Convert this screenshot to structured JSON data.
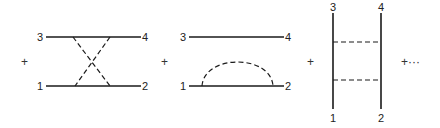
{
  "diagram": {
    "type": "feynman-diagram-series",
    "operators": [
      "+",
      "+",
      "+",
      "+···"
    ],
    "terms": [
      {
        "name": "crossed-exchange",
        "labels": {
          "top_left": "3",
          "top_right": "4",
          "bottom_left": "1",
          "bottom_right": "2"
        },
        "solid_lines": [
          "1-2 horizontal",
          "3-4 horizontal"
        ],
        "dashed_lines": [
          "crossed pair connecting top and bottom lines"
        ]
      },
      {
        "name": "self-energy-loop",
        "labels": {
          "top_left": "3",
          "top_right": "4",
          "bottom_left": "1",
          "bottom_right": "2"
        },
        "solid_lines": [
          "1-2 horizontal",
          "3-4 horizontal"
        ],
        "dashed_lines": [
          "semicircular arc on line 1-2"
        ]
      },
      {
        "name": "ladder-exchange",
        "labels": {
          "top_left": "3",
          "top_right": "4",
          "bottom_left": "1",
          "bottom_right": "2"
        },
        "solid_lines": [
          "1-3 vertical",
          "2-4 vertical"
        ],
        "dashed_lines": [
          "upper rung",
          "lower rung"
        ]
      }
    ]
  }
}
